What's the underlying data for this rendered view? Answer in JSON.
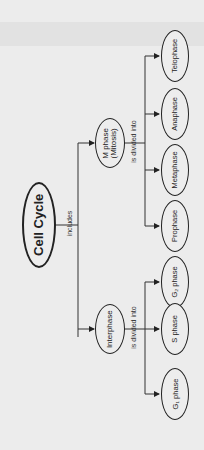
{
  "diagram": {
    "root": {
      "label": "Cell Cycle"
    },
    "root_edge_label": "includes",
    "branches": [
      {
        "label_line1": "M phase",
        "label_line2": "(Mitosis)",
        "edge_label": "is divided into",
        "children": [
          {
            "label": "Prophase"
          },
          {
            "label": "Metaphase"
          },
          {
            "label": "Anaphase"
          },
          {
            "label": "Telophase"
          }
        ]
      },
      {
        "label_line1": "Interphase",
        "edge_label": "is divided into",
        "children": [
          {
            "label": "G₁ phase"
          },
          {
            "label": "S phase"
          },
          {
            "label": "G₂ phase"
          }
        ]
      }
    ]
  },
  "colors": {
    "background": "#ececec",
    "line": "#222222"
  }
}
